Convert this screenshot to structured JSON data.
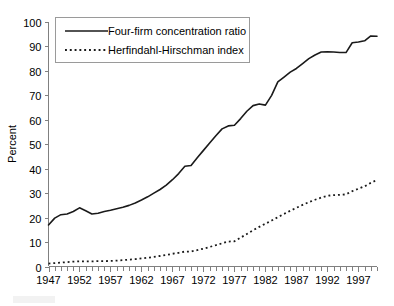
{
  "chart_data": {
    "type": "line",
    "title": "",
    "xlabel": "",
    "ylabel": "Percent",
    "xlim": [
      1947,
      2000
    ],
    "ylim": [
      0,
      100
    ],
    "grid": false,
    "legend_position": "top-left",
    "y_ticks": [
      0,
      10,
      20,
      30,
      40,
      50,
      60,
      70,
      80,
      90,
      100
    ],
    "y_tick_labels": [
      "0",
      "10",
      "20",
      "30",
      "40",
      "50",
      "60",
      "70",
      "80",
      "90",
      "100"
    ],
    "x_ticks": [
      1947,
      1952,
      1957,
      1962,
      1967,
      1972,
      1977,
      1982,
      1987,
      1992,
      1997
    ],
    "x_tick_labels": [
      "1947",
      "1952",
      "1957",
      "1962",
      "1967",
      "1972",
      "1977",
      "1982",
      "1987",
      "1992",
      "1997"
    ],
    "x_minor_tick_interval": 1,
    "x": [
      1947,
      1948,
      1949,
      1950,
      1951,
      1952,
      1953,
      1954,
      1955,
      1956,
      1957,
      1958,
      1959,
      1960,
      1961,
      1962,
      1963,
      1964,
      1965,
      1966,
      1967,
      1968,
      1969,
      1970,
      1971,
      1972,
      1973,
      1974,
      1975,
      1976,
      1977,
      1978,
      1979,
      1980,
      1981,
      1982,
      1983,
      1984,
      1985,
      1986,
      1987,
      1988,
      1989,
      1990,
      1991,
      1992,
      1993,
      1994,
      1995,
      1996,
      1997,
      1998,
      1999,
      2000
    ],
    "series": [
      {
        "name": "Four-firm concentration ratio",
        "style": "solid",
        "color": "#1a1a1a",
        "values": [
          17.0,
          19.8,
          21.2,
          21.5,
          22.5,
          24.0,
          22.8,
          21.5,
          21.8,
          22.5,
          23.0,
          23.6,
          24.2,
          25.0,
          26.0,
          27.2,
          28.5,
          30.0,
          31.5,
          33.3,
          35.5,
          38.0,
          41.0,
          41.3,
          44.5,
          47.5,
          50.5,
          53.5,
          56.3,
          57.5,
          57.8,
          60.5,
          63.5,
          65.8,
          66.5,
          66.0,
          70.0,
          75.5,
          77.5,
          79.5,
          81.0,
          83.0,
          85.0,
          86.5,
          87.7,
          87.8,
          87.7,
          87.5,
          87.5,
          91.5,
          91.8,
          92.3,
          94.3,
          94.2
        ]
      },
      {
        "name": "Herfindahl-Hirschman index",
        "style": "dotted",
        "color": "#1a1a1a",
        "values": [
          1.2,
          1.4,
          1.6,
          1.8,
          2.0,
          2.1,
          2.1,
          2.1,
          2.2,
          2.2,
          2.3,
          2.4,
          2.6,
          2.8,
          3.0,
          3.3,
          3.6,
          3.9,
          4.3,
          4.7,
          5.2,
          5.6,
          6.1,
          6.1,
          6.7,
          7.3,
          8.0,
          8.7,
          9.5,
          10.2,
          10.3,
          11.8,
          13.3,
          14.8,
          16.2,
          17.5,
          18.8,
          20.2,
          21.5,
          22.8,
          24.0,
          25.2,
          26.3,
          27.3,
          28.2,
          28.9,
          29.2,
          29.3,
          29.5,
          30.8,
          31.8,
          32.8,
          34.2,
          35.4
        ]
      }
    ]
  },
  "legend": {
    "entries": [
      {
        "label": "Four-firm concentration ratio",
        "style": "solid"
      },
      {
        "label": "Herfindahl-Hirschman index",
        "style": "dotted"
      }
    ]
  },
  "axes": {
    "y_axis_title": "Percent"
  }
}
